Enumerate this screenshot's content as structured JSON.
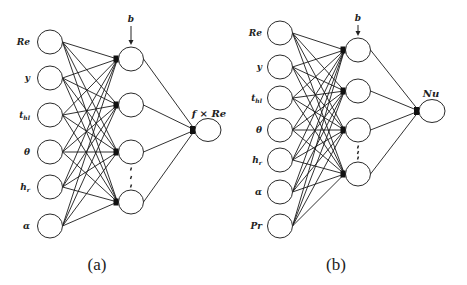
{
  "diagram": {
    "panels": [
      {
        "id": "a",
        "caption": "(a)",
        "inputs": [
          "Re",
          "y",
          "t_hl",
          "θ",
          "h_r",
          "α"
        ],
        "input_labels": [
          "Re",
          "y",
          "thl",
          "θ",
          "hr",
          "α"
        ],
        "hidden_count_visible": 4,
        "hidden_ellipsis": "⋮",
        "bias_label": "b",
        "output_label": "f × Re"
      },
      {
        "id": "b",
        "caption": "(b)",
        "inputs": [
          "Re",
          "y",
          "t_hl",
          "θ",
          "h_r",
          "α",
          "Pr"
        ],
        "input_labels": [
          "Re",
          "y",
          "thl",
          "θ",
          "hr",
          "α",
          "Pr"
        ],
        "hidden_count_visible": 4,
        "hidden_ellipsis": "⋮",
        "bias_label": "b",
        "output_label": "Nu"
      }
    ]
  },
  "geometry": {
    "a": {
      "input_cx": 50,
      "input_cy": [
        42,
        78,
        115,
        152,
        187,
        226
      ],
      "hidden_cx": 131,
      "hidden_cy": [
        59,
        105,
        152,
        202
      ],
      "output_cx": 208,
      "output_cy": 130,
      "label_x": 30,
      "bias_y": 22,
      "output_label_x": 209,
      "output_label_y": 117,
      "caption_x": 97,
      "caption_y": 270,
      "dots_y": 172
    },
    "b": {
      "input_cx": 280,
      "input_cy": [
        33,
        67,
        98,
        130,
        160,
        192,
        226
      ],
      "hidden_cx": 358,
      "hidden_cy": [
        50,
        91,
        130,
        174
      ],
      "output_cx": 432,
      "output_cy": 111,
      "label_x": 262,
      "bias_y": 21,
      "output_label_x": 431,
      "output_label_y": 97,
      "caption_x": 336,
      "caption_y": 270,
      "dots_y": 148
    }
  },
  "colors": {
    "stroke": "#1a1a1a",
    "background": "#ffffff"
  }
}
